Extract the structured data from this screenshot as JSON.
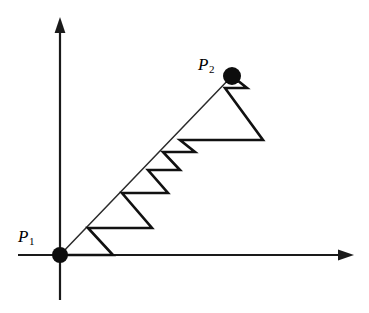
{
  "figure": {
    "background_color": "#ffffff",
    "line_color": "#111111",
    "axis_color": "#1a1a1a",
    "point_color": "#0d0d0d",
    "width": 369,
    "height": 313
  },
  "labels": {
    "p1": {
      "base": "P",
      "sub": "1"
    },
    "p2": {
      "base": "P",
      "sub": "2"
    }
  },
  "chart_data": {
    "type": "diagram",
    "xlabel": "",
    "ylabel": "",
    "grid": false,
    "legend": "none",
    "axes": {
      "origin_px": [
        60,
        255
      ],
      "x_axis": {
        "from_px": [
          18,
          255
        ],
        "to_px": [
          352,
          255
        ],
        "arrow": "right"
      },
      "y_axis": {
        "from_px": [
          60,
          300
        ],
        "to_px": [
          60,
          19
        ],
        "arrow": "up"
      }
    },
    "points": [
      {
        "name": "P1",
        "px": [
          60,
          255
        ],
        "label": "P_1",
        "label_px": [
          18,
          228
        ],
        "marker": "filled-circle",
        "radius_px": 8
      },
      {
        "name": "P2",
        "px": [
          232,
          76
        ],
        "label": "P_2",
        "label_px": [
          198,
          56
        ],
        "marker": "filled-circle",
        "radius_px": 9
      }
    ],
    "main_ray": {
      "from_px": [
        60,
        255
      ],
      "to_px": [
        232,
        76
      ],
      "description": "diagonal line from P1 to P2"
    },
    "staircase": {
      "description": "Sequence of right triangles with horizontal legs and hypotenuses returning to the diagonal; sizes shrink geometrically toward P2",
      "vertices_px": [
        [
          60,
          255
        ],
        [
          113,
          255
        ],
        [
          88,
          228
        ],
        [
          152,
          228
        ],
        [
          122,
          193
        ],
        [
          168,
          193
        ],
        [
          148,
          170
        ],
        [
          180,
          170
        ],
        [
          163,
          152
        ],
        [
          195,
          152
        ],
        [
          180,
          140
        ],
        [
          263,
          140
        ],
        [
          225,
          88
        ],
        [
          247,
          88
        ],
        [
          232,
          76
        ]
      ]
    }
  }
}
